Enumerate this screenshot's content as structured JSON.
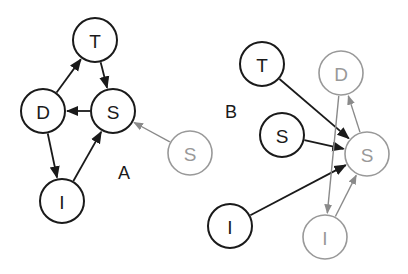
{
  "panels": {
    "A": {
      "label": "A",
      "label_pos": [
        124,
        173
      ],
      "nodes": [
        {
          "id": "A_T",
          "label": "T",
          "x": 95,
          "y": 40,
          "style": "black"
        },
        {
          "id": "A_S",
          "label": "S",
          "x": 113,
          "y": 111,
          "style": "black"
        },
        {
          "id": "A_D",
          "label": "D",
          "x": 43,
          "y": 111,
          "style": "black"
        },
        {
          "id": "A_I",
          "label": "I",
          "x": 62,
          "y": 201,
          "style": "black"
        },
        {
          "id": "A_S2",
          "label": "S",
          "x": 190,
          "y": 153,
          "style": "gray"
        }
      ],
      "edges": [
        {
          "from": "A_T",
          "to": "A_S",
          "style": "black"
        },
        {
          "from": "A_S",
          "to": "A_D",
          "style": "black"
        },
        {
          "from": "A_D",
          "to": "A_T",
          "style": "black"
        },
        {
          "from": "A_D",
          "to": "A_I",
          "style": "black"
        },
        {
          "from": "A_I",
          "to": "A_S",
          "style": "black"
        },
        {
          "from": "A_S2",
          "to": "A_S",
          "style": "gray"
        }
      ]
    },
    "B": {
      "label": "B",
      "label_pos": [
        231,
        112
      ],
      "nodes": [
        {
          "id": "B_T",
          "label": "T",
          "x": 262,
          "y": 64,
          "style": "black"
        },
        {
          "id": "B_D",
          "label": "D",
          "x": 341,
          "y": 73,
          "style": "gray"
        },
        {
          "id": "B_S",
          "label": "S",
          "x": 282,
          "y": 135,
          "style": "black"
        },
        {
          "id": "B_S2",
          "label": "S",
          "x": 367,
          "y": 154,
          "style": "gray"
        },
        {
          "id": "B_I",
          "label": "I",
          "x": 230,
          "y": 226,
          "style": "black"
        },
        {
          "id": "B_I2",
          "label": "I",
          "x": 325,
          "y": 237,
          "style": "gray"
        }
      ],
      "edges": [
        {
          "from": "B_T",
          "to": "B_S2",
          "style": "black"
        },
        {
          "from": "B_S",
          "to": "B_S2",
          "style": "black"
        },
        {
          "from": "B_I",
          "to": "B_S2",
          "style": "black"
        },
        {
          "from": "B_S2",
          "to": "B_D",
          "style": "gray"
        },
        {
          "from": "B_D",
          "to": "B_I2",
          "style": "gray"
        },
        {
          "from": "B_I2",
          "to": "B_S2",
          "style": "gray"
        }
      ]
    }
  },
  "node_radius": 22,
  "colors": {
    "black": "#1a1a1a",
    "gray": "#999999",
    "gray_edge": "#8a8a8a",
    "background": "#ffffff"
  }
}
